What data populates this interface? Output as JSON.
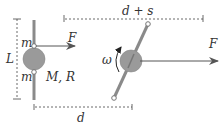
{
  "diagram": {
    "left_config": {
      "labels": {
        "length": "L",
        "mass_top": "m",
        "mass_bottom": "m",
        "disk": "M, R",
        "force": "F",
        "distance": "d"
      }
    },
    "right_config": {
      "labels": {
        "angular_velocity": "ω",
        "force": "F",
        "distance": "d + s"
      }
    },
    "colors": {
      "rod": "#8a8a8a",
      "disk": "#9a9a9a",
      "arrow": "#555555",
      "dimension": "#444444",
      "text": "#333333"
    }
  }
}
